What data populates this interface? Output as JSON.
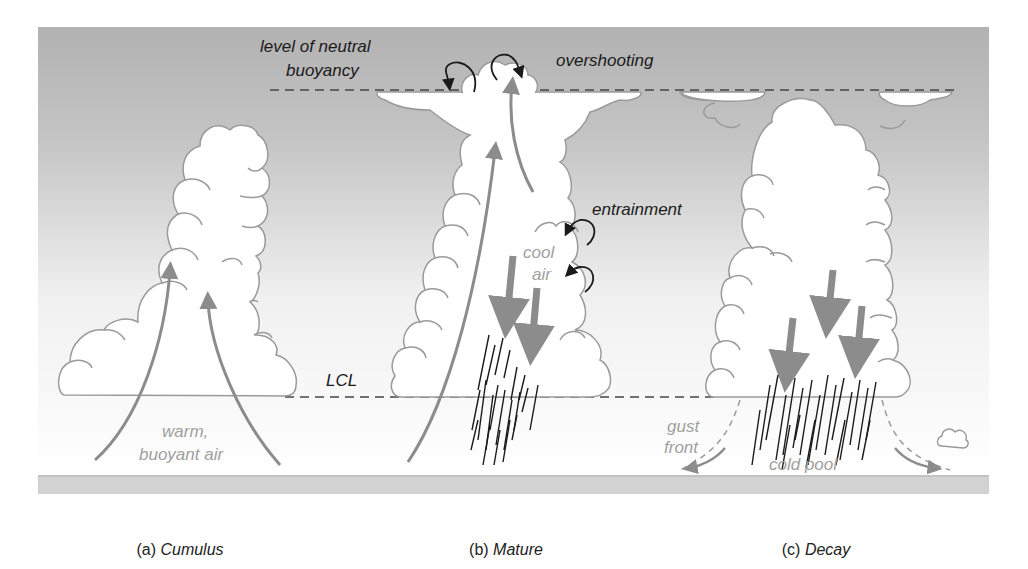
{
  "figure": {
    "colors": {
      "sky_top": "#b4b4b4",
      "sky_bottom": "#ffffff",
      "cloud_fill": "#ffffff",
      "cloud_outline": "#9a9a9a",
      "updraft_arrow": "#8c8c8c",
      "downdraft_arrow": "#8c8c8c",
      "circulation_arrow": "#1a1a1a",
      "rain": "#1a1a1a",
      "ground": "#cfcfcf",
      "dashed_level": "#444444"
    },
    "labels": {
      "lnb_line1": "level of neutral",
      "lnb_line2": "buoyancy",
      "overshooting": "overshooting",
      "entrainment": "entrainment",
      "cool": "cool",
      "air": "air",
      "lcl": "LCL",
      "warm": "warm,",
      "buoyant_air": "buoyant air",
      "gust": "gust",
      "front": "front",
      "cold_pool": "cold pool"
    },
    "panels": [
      {
        "prefix": "(a)",
        "name": "Cumulus"
      },
      {
        "prefix": "(b)",
        "name": "Mature"
      },
      {
        "prefix": "(c)",
        "name": "Decay"
      }
    ]
  }
}
